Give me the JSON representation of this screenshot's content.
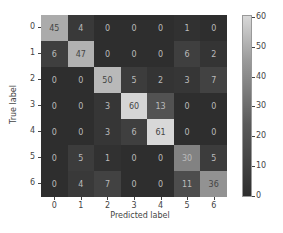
{
  "chart_data": {
    "type": "heatmap",
    "title": "",
    "xlabel": "Predicted label",
    "ylabel": "True label",
    "x_categories": [
      "0",
      "1",
      "2",
      "3",
      "4",
      "5",
      "6"
    ],
    "y_categories": [
      "0",
      "1",
      "2",
      "3",
      "4",
      "5",
      "6"
    ],
    "matrix": [
      [
        45,
        4,
        0,
        0,
        0,
        1,
        0
      ],
      [
        6,
        47,
        0,
        0,
        0,
        6,
        2
      ],
      [
        0,
        0,
        50,
        5,
        2,
        3,
        7
      ],
      [
        0,
        0,
        3,
        60,
        13,
        0,
        0
      ],
      [
        0,
        0,
        3,
        6,
        61,
        0,
        0
      ],
      [
        0,
        5,
        1,
        0,
        0,
        30,
        5
      ],
      [
        0,
        4,
        7,
        0,
        0,
        11,
        36
      ]
    ],
    "colorbar": {
      "ticks": [
        "0",
        "10",
        "20",
        "30",
        "40",
        "50",
        "60"
      ],
      "range": [
        0,
        61
      ]
    },
    "colormap": "gray"
  }
}
